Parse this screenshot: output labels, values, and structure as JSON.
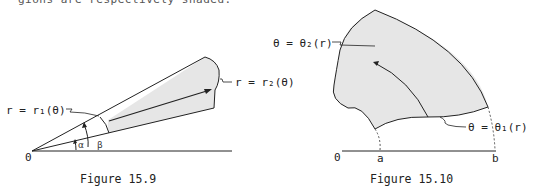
{
  "header": {
    "partial_text": "gions are respectively shaded."
  },
  "figure_15_9": {
    "caption": "Figure 15.9",
    "origin_label": "0",
    "inner_curve_label": "r = r₁(θ)",
    "outer_curve_label": "r = r₂(θ)",
    "angle_alpha": "α",
    "angle_beta": "β"
  },
  "figure_15_10": {
    "caption": "Figure 15.10",
    "origin_label": "0",
    "a_label": "a",
    "b_label": "b",
    "upper_curve_label": "θ = θ₂(r)",
    "lower_curve_label": "θ = θ₁(r)"
  },
  "colors": {
    "shade": "#e6e6e6",
    "stroke": "#222222"
  }
}
